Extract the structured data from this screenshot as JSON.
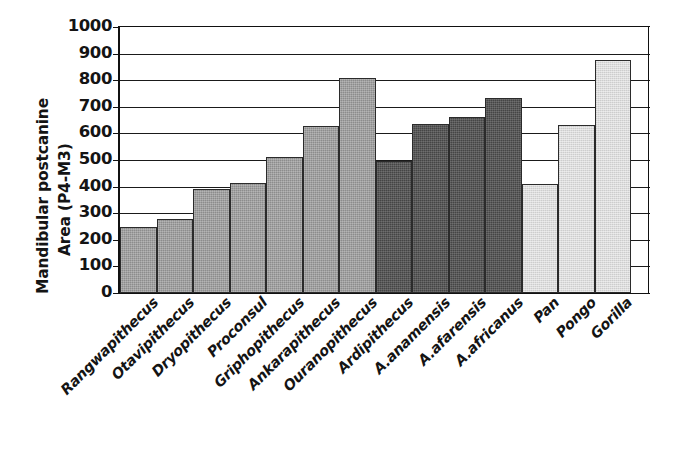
{
  "chart_data": {
    "type": "bar",
    "title": "",
    "xlabel": "",
    "ylabel": "Mandibular postcanine Area (P4-M3)",
    "ylabel_lines": [
      "Mandibular postcanine",
      "Area (P4-M3)"
    ],
    "ylim": [
      0,
      1000
    ],
    "ytick_values": [
      1000,
      900,
      800,
      700,
      600,
      500,
      400,
      300,
      200,
      100,
      0
    ],
    "ytick_labels": [
      "1000",
      "900",
      "800",
      "700",
      "600",
      "500",
      "400",
      "300",
      "200",
      "100",
      "0"
    ],
    "grid": true,
    "grid_axis": "y",
    "legend": "none",
    "categories": [
      "Rangwapithecus",
      "Otavipithecus",
      "Dryopithecus",
      "Proconsul",
      "Griphopithecus",
      "Ankarapithecus",
      "Ouranopithecus",
      "Ardipithecus",
      "A.anamensis",
      "A.afarensis",
      "A.africanus",
      "Pan",
      "Pongo",
      "Gorilla"
    ],
    "values": [
      247,
      278,
      390,
      415,
      512,
      628,
      810,
      495,
      637,
      660,
      735,
      410,
      632,
      875
    ],
    "groups": [
      "fossil-ape",
      "fossil-ape",
      "fossil-ape",
      "fossil-ape",
      "fossil-ape",
      "fossil-ape",
      "fossil-ape",
      "hominin",
      "hominin",
      "hominin",
      "hominin",
      "extant-ape",
      "extant-ape",
      "extant-ape"
    ],
    "group_colors": {
      "fossil-ape": "#8c8c8c",
      "hominin": "#454545",
      "extant-ape": "#dcdcdc"
    },
    "bar_outline_color": "#2b2b2b",
    "axis_color": "#111111",
    "background_color": "#ffffff"
  }
}
